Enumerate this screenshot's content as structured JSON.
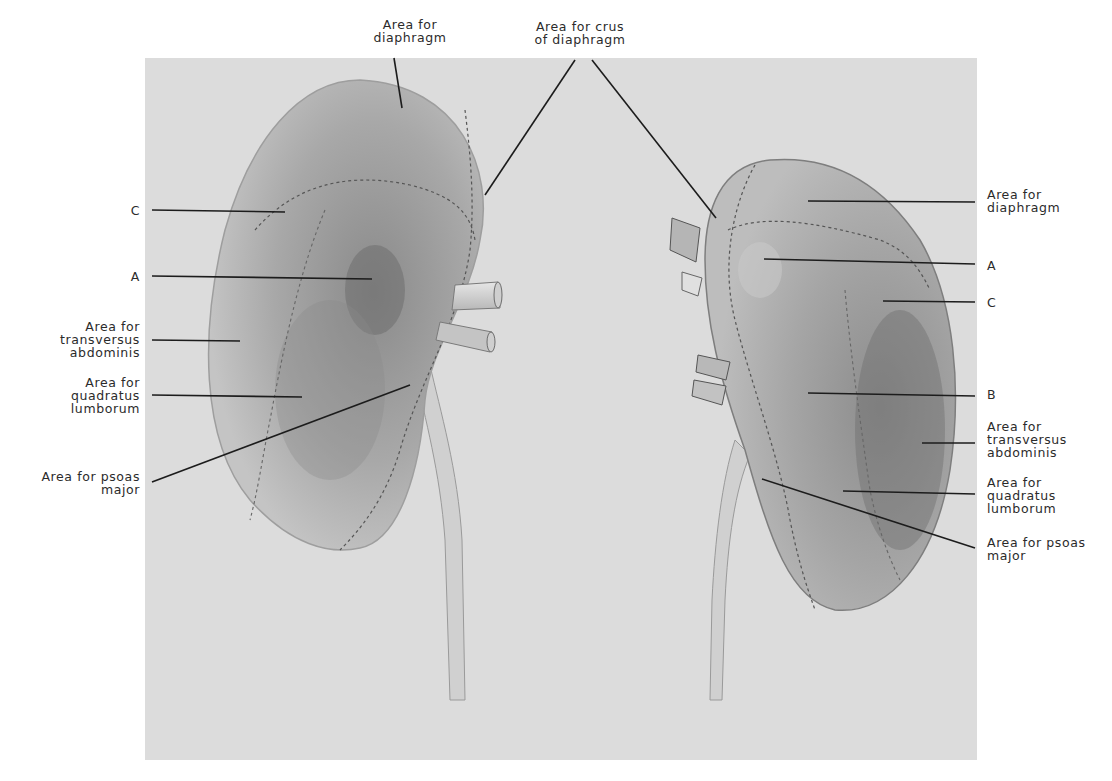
{
  "figure": {
    "background": "#dcdcdc",
    "kidney_left": {
      "name": "left kidney (posterior view)",
      "labels": {
        "top_diaphragm": "Area for\ndiaphragm",
        "top_crus": "Area for crus\nof diaphragm",
        "c": "C",
        "a": "A",
        "transversus": "Area for\ntransversus\nabdominis",
        "quadratus": "Area for\nquadratus\nlumborum",
        "psoas": "Area for psoas\nmajor"
      }
    },
    "kidney_right": {
      "name": "right kidney (posterior view)",
      "labels": {
        "diaphragm": "Area for\ndiaphragm",
        "a": "A",
        "c": "C",
        "b": "B",
        "transversus": "Area for\ntransversus\nabdominis",
        "quadratus": "Area for\nquadratus\nlumborum",
        "psoas": "Area for psoas\nmajor"
      }
    }
  }
}
